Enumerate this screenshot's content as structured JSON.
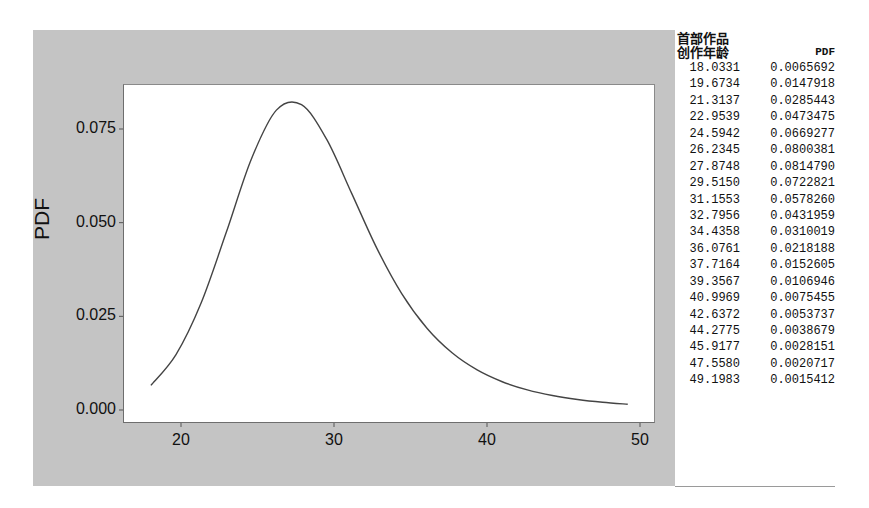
{
  "chart_data": {
    "type": "line",
    "title": "",
    "xlabel": "",
    "ylabel": "PDF",
    "xlim": [
      14.3,
      51.0
    ],
    "ylim": [
      -0.0035,
      0.087
    ],
    "x_ticks": [
      "20",
      "30",
      "40",
      "50"
    ],
    "y_ticks": [
      "0.000",
      "0.025",
      "0.050",
      "0.075"
    ],
    "grid": false,
    "legend": null,
    "series": [
      {
        "name": "PDF",
        "x": [
          18.0331,
          19.6734,
          21.3137,
          22.9539,
          24.5942,
          26.2345,
          27.8748,
          29.515,
          31.1553,
          32.7956,
          34.4358,
          36.0761,
          37.7164,
          39.3567,
          40.9969,
          42.6372,
          44.2775,
          45.9177,
          47.558,
          49.1983
        ],
        "y": [
          0.0065692,
          0.0147918,
          0.0285443,
          0.0473475,
          0.0669277,
          0.0800381,
          0.081479,
          0.0722821,
          0.057826,
          0.0431959,
          0.0310019,
          0.0218188,
          0.0152605,
          0.0106946,
          0.0075455,
          0.0053737,
          0.0038679,
          0.0028151,
          0.0020717,
          0.0015412
        ]
      }
    ]
  },
  "table": {
    "header_col1_line1": "首部作品",
    "header_col1_line2": "创作年龄",
    "header_col2": "PDF",
    "rows": [
      [
        "18.0331",
        "0.0065692"
      ],
      [
        "19.6734",
        "0.0147918"
      ],
      [
        "21.3137",
        "0.0285443"
      ],
      [
        "22.9539",
        "0.0473475"
      ],
      [
        "24.5942",
        "0.0669277"
      ],
      [
        "26.2345",
        "0.0800381"
      ],
      [
        "27.8748",
        "0.0814790"
      ],
      [
        "29.5150",
        "0.0722821"
      ],
      [
        "31.1553",
        "0.0578260"
      ],
      [
        "32.7956",
        "0.0431959"
      ],
      [
        "34.4358",
        "0.0310019"
      ],
      [
        "36.0761",
        "0.0218188"
      ],
      [
        "37.7164",
        "0.0152605"
      ],
      [
        "39.3567",
        "0.0106946"
      ],
      [
        "40.9969",
        "0.0075455"
      ],
      [
        "42.6372",
        "0.0053737"
      ],
      [
        "44.2775",
        "0.0038679"
      ],
      [
        "45.9177",
        "0.0028151"
      ],
      [
        "47.5580",
        "0.0020717"
      ],
      [
        "49.1983",
        "0.0015412"
      ]
    ]
  },
  "colors": {
    "panel_bg": "#c4c4c4",
    "plot_bg": "#ffffff",
    "line": "#444444"
  }
}
